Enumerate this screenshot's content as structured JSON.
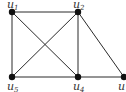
{
  "graph": {
    "nodes": [
      {
        "id": "u1",
        "base": "u",
        "sub": "1",
        "x": 12,
        "y": 12,
        "lx": 7,
        "ly": 8
      },
      {
        "id": "u2",
        "base": "u",
        "sub": "2",
        "x": 78,
        "y": 12,
        "lx": 73,
        "ly": 8
      },
      {
        "id": "u3",
        "base": "u",
        "sub": "",
        "x": 124,
        "y": 77,
        "lx": 118,
        "ly": 90
      },
      {
        "id": "u4",
        "base": "u",
        "sub": "4",
        "x": 78,
        "y": 77,
        "lx": 73,
        "ly": 90
      },
      {
        "id": "u5",
        "base": "u",
        "sub": "5",
        "x": 12,
        "y": 77,
        "lx": 7,
        "ly": 90
      }
    ],
    "edges": [
      [
        "u1",
        "u2"
      ],
      [
        "u1",
        "u5"
      ],
      [
        "u1",
        "u4"
      ],
      [
        "u2",
        "u5"
      ],
      [
        "u2",
        "u4"
      ],
      [
        "u2",
        "u3"
      ],
      [
        "u5",
        "u4"
      ],
      [
        "u4",
        "u3"
      ]
    ],
    "colors": {
      "edge": "#2a2a2a",
      "node": "#111111",
      "label": "#333333"
    }
  }
}
